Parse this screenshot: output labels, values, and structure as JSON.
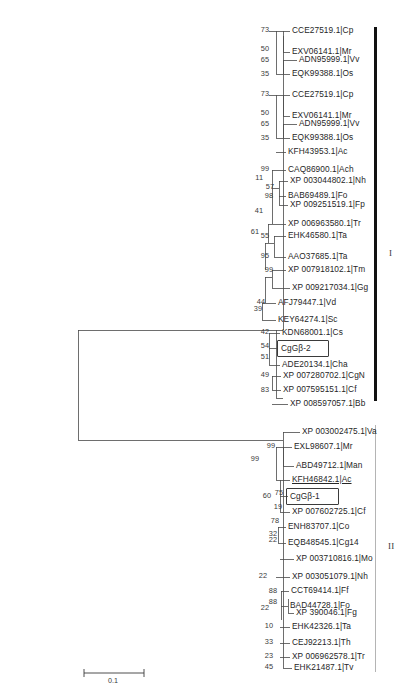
{
  "figure": {
    "type": "phylogenetic-tree",
    "scale_bar": {
      "label": "0.1",
      "length_px": 60
    },
    "clades": [
      {
        "id": "I",
        "numeral": "I",
        "style": "thick-black-bar"
      },
      {
        "id": "II",
        "numeral": "II",
        "style": "thin-gray-bar"
      }
    ]
  },
  "taxa": [
    {
      "i": 0,
      "label": "CCE27519.1|Cp",
      "clade": "I"
    },
    {
      "i": 1,
      "label": "EXV06141.1|Mr",
      "clade": "I"
    },
    {
      "i": 2,
      "label": "ADN95999.1|Vv",
      "clade": "I"
    },
    {
      "i": 3,
      "label": "EQK99388.1|Os",
      "clade": "I"
    },
    {
      "i": 4,
      "label": "CCE27519.1|Cp",
      "clade": "I"
    },
    {
      "i": 5,
      "label": "EXV06141.1|Mr",
      "clade": "I"
    },
    {
      "i": 6,
      "label": "ADN95999.1|Vv",
      "clade": "I"
    },
    {
      "i": 7,
      "label": "EQK99388.1|Os",
      "clade": "I"
    },
    {
      "i": 8,
      "label": "KFH43953.1|Ac",
      "clade": "I"
    },
    {
      "i": 9,
      "label": "CAQ86900.1|Ach",
      "clade": "I"
    },
    {
      "i": 10,
      "label": "XP 003044802.1|Nh",
      "clade": "I"
    },
    {
      "i": 11,
      "label": "BAB69489.1|Fo",
      "clade": "I"
    },
    {
      "i": 12,
      "label": "XP 009251519.1|Fp",
      "clade": "I"
    },
    {
      "i": 13,
      "label": "XP 006963580.1|Tr",
      "clade": "I"
    },
    {
      "i": 14,
      "label": "EHK46580.1|Ta",
      "clade": "I"
    },
    {
      "i": 15,
      "label": "AAO37685.1|Ta",
      "clade": "I"
    },
    {
      "i": 16,
      "label": "XP 007918102.1|Tm",
      "clade": "I"
    },
    {
      "i": 17,
      "label": "XP 009217034.1|Gg",
      "clade": "I"
    },
    {
      "i": 18,
      "label": "AFJ79447.1|Vd",
      "clade": "I"
    },
    {
      "i": 19,
      "label": "KEY64274.1|Sc",
      "clade": "I"
    },
    {
      "i": 20,
      "label": "KDN68001.1|Cs",
      "clade": "I"
    },
    {
      "i": 21,
      "label": "CgGβ-2",
      "clade": "I",
      "boxed": true
    },
    {
      "i": 22,
      "label": "ADE20134.1|Cha",
      "clade": "I"
    },
    {
      "i": 23,
      "label": "XP 007280702.1|CgN",
      "clade": "I"
    },
    {
      "i": 24,
      "label": "XP 007595151.1|Cf",
      "clade": "I"
    },
    {
      "i": 25,
      "label": "XP 008597057.1|Bb",
      "clade": "I"
    },
    {
      "i": 26,
      "label": "XP 003002475.1|Va",
      "clade": "II"
    },
    {
      "i": 27,
      "label": "EXL98607.1|Mr",
      "clade": "II"
    },
    {
      "i": 28,
      "label": "ABD49712.1|Man",
      "clade": "II"
    },
    {
      "i": 29,
      "label": "KFH46842.1|Ac",
      "clade": "II",
      "underlined": true
    },
    {
      "i": 30,
      "label": "CgGβ-1",
      "clade": "II",
      "boxed": true
    },
    {
      "i": 31,
      "label": "XP 007602725.1|Cf",
      "clade": "II"
    },
    {
      "i": 32,
      "label": "ENH83707.1|Co",
      "clade": "II"
    },
    {
      "i": 33,
      "label": "EQB48545.1|Cg14",
      "clade": "II"
    },
    {
      "i": 34,
      "label": "XP 003710816.1|Mo",
      "clade": "II"
    },
    {
      "i": 35,
      "label": "XP 003051079.1|Nh",
      "clade": "II"
    },
    {
      "i": 36,
      "label": "CCT69414.1|Ff",
      "clade": "II"
    },
    {
      "i": 37,
      "label": "BAD44728.1|Fo",
      "clade": "II"
    },
    {
      "i": 38,
      "label": "XP 390046.1|Fg",
      "clade": "II"
    },
    {
      "i": 39,
      "label": "EHK42326.1|Ta",
      "clade": "II"
    },
    {
      "i": 40,
      "label": "CEJ92213.1|Th",
      "clade": "II"
    },
    {
      "i": 41,
      "label": "XP 006962578.1|Tr",
      "clade": "II"
    },
    {
      "i": 42,
      "label": "EHK21487.1|Tv",
      "clade": "II"
    }
  ],
  "bootstrap_values": [
    {
      "id": "b0",
      "value": "73"
    },
    {
      "id": "b1",
      "value": "50"
    },
    {
      "id": "b2",
      "value": "65"
    },
    {
      "id": "b3",
      "value": "35"
    },
    {
      "id": "b4",
      "value": "73"
    },
    {
      "id": "b5",
      "value": "50"
    },
    {
      "id": "b6",
      "value": "65"
    },
    {
      "id": "b7",
      "value": "35"
    },
    {
      "id": "b8",
      "value": "99"
    },
    {
      "id": "b9",
      "value": "11"
    },
    {
      "id": "b10",
      "value": "57"
    },
    {
      "id": "b11",
      "value": "98"
    },
    {
      "id": "b12",
      "value": "41"
    },
    {
      "id": "b13",
      "value": "61"
    },
    {
      "id": "b14",
      "value": "55"
    },
    {
      "id": "b15",
      "value": "95"
    },
    {
      "id": "b16",
      "value": "99"
    },
    {
      "id": "b17",
      "value": "44"
    },
    {
      "id": "b18",
      "value": "39"
    },
    {
      "id": "b19",
      "value": "42"
    },
    {
      "id": "b20",
      "value": "54"
    },
    {
      "id": "b21",
      "value": "51"
    },
    {
      "id": "b22",
      "value": "49"
    },
    {
      "id": "b23",
      "value": "83"
    },
    {
      "id": "b24",
      "value": "99"
    },
    {
      "id": "b25",
      "value": "99"
    },
    {
      "id": "b26",
      "value": "60"
    },
    {
      "id": "b27",
      "value": "75"
    },
    {
      "id": "b28",
      "value": "19"
    },
    {
      "id": "b29",
      "value": "78"
    },
    {
      "id": "b30",
      "value": "32"
    },
    {
      "id": "b31",
      "value": "22"
    },
    {
      "id": "b32",
      "value": "22"
    },
    {
      "id": "b33",
      "value": "88"
    },
    {
      "id": "b34",
      "value": "88"
    },
    {
      "id": "b35",
      "value": "22"
    },
    {
      "id": "b36",
      "value": "10"
    },
    {
      "id": "b37",
      "value": "33"
    },
    {
      "id": "b38",
      "value": "23"
    },
    {
      "id": "b39",
      "value": "45"
    }
  ]
}
